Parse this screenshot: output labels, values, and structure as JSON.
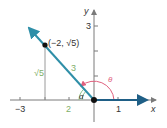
{
  "diagram": {
    "type": "angle-in-standard-position",
    "colors": {
      "axis": "#7a7a7a",
      "ray": "#2f8fa8",
      "ray_dark": "#1f5f86",
      "point": "#111111",
      "green_label": "#7fb069",
      "theta_arc": "#e0607e",
      "alpha_arc": "#8cc08a",
      "guide": "#9a9a9a",
      "text": "#333333"
    },
    "axes": {
      "x_label": "x",
      "y_label": "y",
      "x_ticks": [
        {
          "value": -3,
          "label": "−3"
        },
        {
          "value": -2,
          "label": ""
        },
        {
          "value": -1,
          "label": ""
        },
        {
          "value": 1,
          "label": "1"
        }
      ],
      "y_ticks": [
        {
          "value": 1,
          "label": ""
        },
        {
          "value": 2,
          "label": ""
        },
        {
          "value": 3,
          "label": "3"
        }
      ]
    },
    "point": {
      "label": "(−2, √5)",
      "x": -2,
      "y": "√5"
    },
    "labels": {
      "vertical_side": "√5",
      "hypotenuse": "3",
      "horizontal_side": "2",
      "reference_angle": "α",
      "angle": "θ"
    }
  }
}
